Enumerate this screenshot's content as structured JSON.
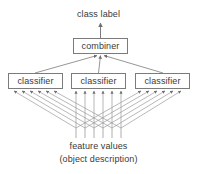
{
  "diagram": {
    "title_top": "class label",
    "caption_line1": "feature values",
    "caption_line2": "(object description)",
    "nodes": {
      "combiner": "combiner",
      "classifier_left": "classifier",
      "classifier_middle": "classifier",
      "classifier_right": "classifier"
    },
    "colors": {
      "stroke": "#7b7b7b",
      "text": "#3a3a3a",
      "background": "#ffffff"
    },
    "structure": {
      "feature_count": 6,
      "classifier_count": 3,
      "flow": "bottom-up",
      "description": "feature values fan out to three classifiers, whose outputs converge on a combiner producing a class label"
    }
  }
}
